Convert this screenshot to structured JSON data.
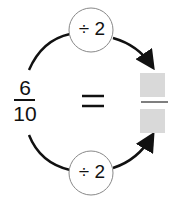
{
  "left_fraction": {
    "numerator": "6",
    "denominator": "10"
  },
  "equals_sign": "=",
  "top_operation": "÷ 2",
  "bottom_operation": "÷ 2",
  "right_fraction": {
    "numerator": "",
    "denominator": ""
  },
  "colors": {
    "line": "#111111",
    "box": "#d9d9d9",
    "circle_stroke": "#888888"
  }
}
